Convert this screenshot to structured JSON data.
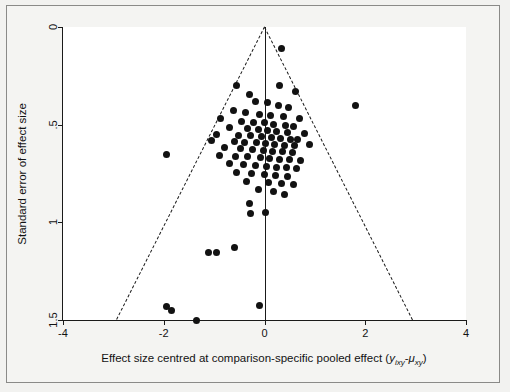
{
  "chart_data": {
    "type": "scatter",
    "title": "",
    "xlabel": "Effect size centred at comparison-specific pooled effect (y_ixy-μ_xy)",
    "ylabel": "Standard error of effect size",
    "xlim": [
      -4,
      4
    ],
    "ylim": [
      1.5,
      0
    ],
    "y_inverted": true,
    "xticks": [
      -4,
      -2,
      0,
      2,
      4
    ],
    "xticklabels": [
      "-4",
      "-2",
      "0",
      "2",
      "4"
    ],
    "yticks": [
      0,
      0.5,
      1,
      1.5
    ],
    "yticklabels": [
      "0",
      ".5",
      "1",
      "1.5"
    ],
    "grid": false,
    "legend": null,
    "reference_line_x": 0,
    "funnel_pseudo_95_slope": 1.96,
    "points": [
      [
        0.33,
        0.11
      ],
      [
        -0.55,
        0.3
      ],
      [
        0.3,
        0.3
      ],
      [
        0.62,
        0.33
      ],
      [
        -0.3,
        0.345
      ],
      [
        1.8,
        0.4
      ],
      [
        -0.18,
        0.38
      ],
      [
        0.05,
        0.385
      ],
      [
        0.27,
        0.4
      ],
      [
        0.48,
        0.41
      ],
      [
        -0.62,
        0.43
      ],
      [
        -0.38,
        0.44
      ],
      [
        -0.1,
        0.45
      ],
      [
        0.12,
        0.455
      ],
      [
        0.38,
        0.46
      ],
      [
        0.7,
        0.47
      ],
      [
        -0.88,
        0.47
      ],
      [
        -0.45,
        0.485
      ],
      [
        -0.22,
        0.49
      ],
      [
        0.0,
        0.49
      ],
      [
        0.18,
        0.5
      ],
      [
        0.42,
        0.505
      ],
      [
        0.58,
        0.51
      ],
      [
        -0.7,
        0.515
      ],
      [
        -0.33,
        0.52
      ],
      [
        -0.12,
        0.525
      ],
      [
        0.06,
        0.53
      ],
      [
        0.24,
        0.535
      ],
      [
        0.45,
        0.54
      ],
      [
        0.8,
        0.545
      ],
      [
        -0.95,
        0.55
      ],
      [
        -0.52,
        0.555
      ],
      [
        -0.28,
        0.555
      ],
      [
        -0.05,
        0.56
      ],
      [
        0.14,
        0.565
      ],
      [
        0.32,
        0.57
      ],
      [
        0.52,
        0.575
      ],
      [
        0.66,
        0.575
      ],
      [
        -1.05,
        0.58
      ],
      [
        -0.6,
        0.585
      ],
      [
        -0.4,
        0.59
      ],
      [
        -0.16,
        0.59
      ],
      [
        0.02,
        0.595
      ],
      [
        0.2,
        0.6
      ],
      [
        0.4,
        0.605
      ],
      [
        0.6,
        0.605
      ],
      [
        0.9,
        0.6
      ],
      [
        -0.8,
        0.615
      ],
      [
        -0.48,
        0.62
      ],
      [
        -0.24,
        0.625
      ],
      [
        -0.02,
        0.63
      ],
      [
        0.16,
        0.635
      ],
      [
        0.36,
        0.635
      ],
      [
        0.56,
        0.64
      ],
      [
        -1.95,
        0.655
      ],
      [
        -0.9,
        0.66
      ],
      [
        -0.58,
        0.665
      ],
      [
        -0.34,
        0.665
      ],
      [
        -0.08,
        0.67
      ],
      [
        0.1,
        0.675
      ],
      [
        0.3,
        0.68
      ],
      [
        0.5,
        0.68
      ],
      [
        0.72,
        0.685
      ],
      [
        -0.7,
        0.7
      ],
      [
        -0.42,
        0.705
      ],
      [
        -0.18,
        0.71
      ],
      [
        0.04,
        0.715
      ],
      [
        0.24,
        0.72
      ],
      [
        0.44,
        0.72
      ],
      [
        0.64,
        0.725
      ],
      [
        -0.55,
        0.745
      ],
      [
        -0.26,
        0.75
      ],
      [
        0.0,
        0.755
      ],
      [
        0.22,
        0.76
      ],
      [
        0.46,
        0.765
      ],
      [
        -0.36,
        0.79
      ],
      [
        0.08,
        0.795
      ],
      [
        0.34,
        0.8
      ],
      [
        0.58,
        0.805
      ],
      [
        -0.12,
        0.83
      ],
      [
        0.18,
        0.84
      ],
      [
        0.4,
        0.855
      ],
      [
        -0.3,
        0.905
      ],
      [
        -0.28,
        0.955
      ],
      [
        0.02,
        0.95
      ],
      [
        -0.6,
        1.13
      ],
      [
        -0.95,
        1.155
      ],
      [
        -1.12,
        1.155
      ],
      [
        -1.95,
        1.43
      ],
      [
        -1.85,
        1.45
      ],
      [
        -1.35,
        1.5
      ],
      [
        -0.1,
        1.425
      ]
    ]
  },
  "axis": {
    "x_title_prefix": "Effect size centred at comparison-specific pooled effect (",
    "x_title_math_y": "y",
    "x_title_math_y_sub": "ixy",
    "x_title_math_minus": "-",
    "x_title_math_mu": "μ",
    "x_title_math_mu_sub": "xy",
    "x_title_suffix": ")",
    "y_title": "Standard error of effect size"
  }
}
